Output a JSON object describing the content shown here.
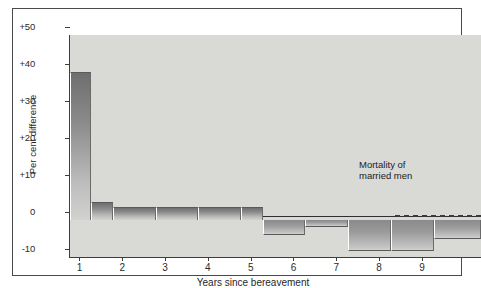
{
  "chart_data": {
    "type": "bar",
    "title": "",
    "xlabel": "Years since bereavement",
    "ylabel": "Per cent difference",
    "ylim": [
      -10,
      50
    ],
    "xlim": [
      0,
      9.6
    ],
    "grid": false,
    "legend": false,
    "y_ticks": [
      "+50",
      "+40",
      "+30",
      "+20",
      "+10",
      "0",
      "-10"
    ],
    "y_tick_values": [
      50,
      40,
      30,
      20,
      10,
      0,
      -10
    ],
    "x_ticks": [
      "1",
      "2",
      "3",
      "4",
      "5",
      "6",
      "7",
      "8",
      "9"
    ],
    "x_tick_values": [
      1,
      2,
      3,
      4,
      5,
      6,
      7,
      8,
      9
    ],
    "annotations": [
      {
        "text_line1": "Mortality of",
        "text_line2": "married men",
        "reference_value": 0,
        "style": "dashed-line"
      }
    ],
    "bars": [
      {
        "label": "0.0-0.5",
        "x_start": 0.0,
        "x_end": 0.5,
        "value": 40.0
      },
      {
        "label": "0.5-1.0",
        "x_start": 0.5,
        "x_end": 1.0,
        "value": 5.0
      },
      {
        "label": "1.0-2.0",
        "x_start": 1.0,
        "x_end": 2.0,
        "value": 3.5
      },
      {
        "label": "2.0-3.0",
        "x_start": 2.0,
        "x_end": 3.0,
        "value": 3.5
      },
      {
        "label": "3.0-4.0",
        "x_start": 3.0,
        "x_end": 4.0,
        "value": 3.5
      },
      {
        "label": "4.0-4.5",
        "x_start": 4.0,
        "x_end": 4.5,
        "value": 3.5
      },
      {
        "label": "4.5-5.5",
        "x_start": 4.5,
        "x_end": 5.5,
        "value": -4.0
      },
      {
        "label": "5.5-6.5",
        "x_start": 5.5,
        "x_end": 6.5,
        "value": -2.0
      },
      {
        "label": "6.5-7.5",
        "x_start": 6.5,
        "x_end": 7.5,
        "value": -8.5
      },
      {
        "label": "7.5-8.5",
        "x_start": 7.5,
        "x_end": 8.5,
        "value": -8.5
      },
      {
        "label": "8.5-9.6",
        "x_start": 8.5,
        "x_end": 9.6,
        "value": -5.0
      }
    ],
    "colors": {
      "plot_background": "#d9d9d6",
      "bar_dark": "#6e6e6e",
      "bar_light": "#d2d2d0",
      "axis": "#3d3d3d",
      "text": "#1f1f1f",
      "page_background": "#ffffff",
      "frame_border": "#4a4a4a"
    }
  }
}
